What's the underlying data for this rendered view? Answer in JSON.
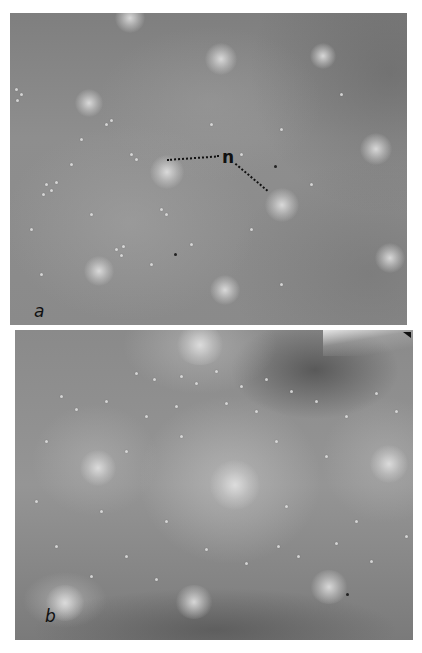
{
  "figure": {
    "panels": [
      {
        "id": "a",
        "label": "a",
        "description": "micrograph, grayscale, granular field with diffuse bright spots",
        "annotations": [
          {
            "label": "n",
            "meaning": "marker with two dotted leader lines pointing to bright spots"
          }
        ]
      },
      {
        "id": "b",
        "label": "b",
        "description": "micrograph, grayscale, granular field with scattered bright particles and diffuse bright regions"
      }
    ],
    "colors": {
      "background": "#ffffff",
      "field_gray": "#8a8a8a",
      "label_ink": "#111111"
    }
  }
}
